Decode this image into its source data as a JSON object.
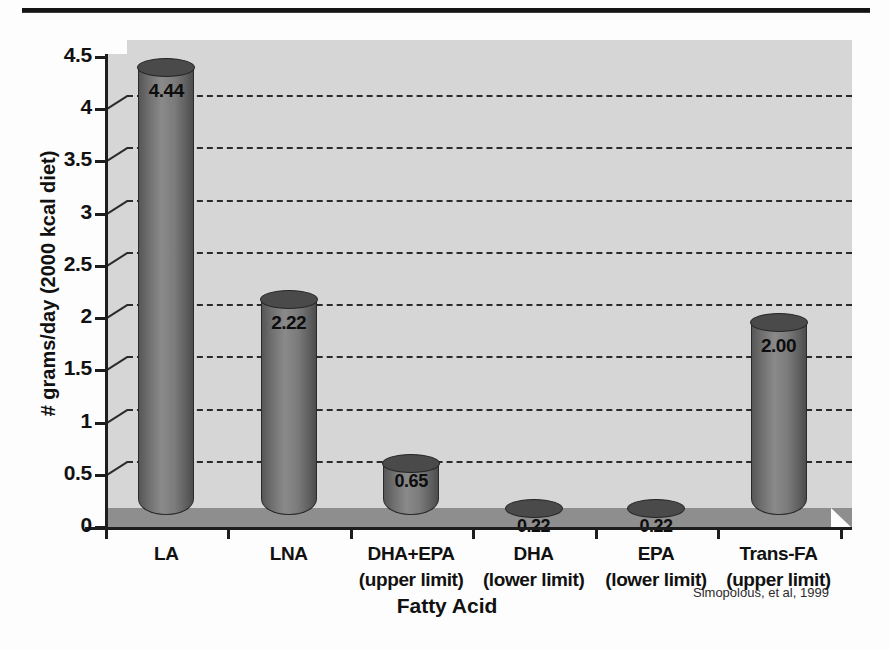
{
  "figure": {
    "citation": "Simopolous, et al, 1999",
    "colors": {
      "plot_background": "#d6d6d6",
      "floor": "#8e8e8e",
      "bar_fill": "#7b7b7b",
      "bar_top": "#4a4a4a",
      "axis": "#1d1d1d",
      "gridline": "#2b2b2b",
      "page_background": "#fdfdfd",
      "rule": "#141414"
    }
  },
  "chart_data": {
    "type": "bar",
    "title": "",
    "subtitle": "",
    "xlabel": "Fatty Acid",
    "ylabel": "# grams/day (2000 kcal diet)",
    "categories": [
      "LA",
      "LNA",
      "DHA+EPA",
      "DHA",
      "EPA",
      "Trans-FA"
    ],
    "category_sublabels": [
      "",
      "",
      "(upper limit)",
      "(lower limit)",
      "(lower limit)",
      "(upper limit)"
    ],
    "values": [
      4.44,
      2.22,
      0.65,
      0.22,
      0.22,
      2.0
    ],
    "value_labels": [
      "4.44",
      "2.22",
      "0.65",
      "0.22",
      "0.22",
      "2.00"
    ],
    "ylim": [
      0,
      4.5
    ],
    "ytick_values": [
      0,
      0.5,
      1,
      1.5,
      2,
      2.5,
      3,
      3.5,
      4,
      4.5
    ],
    "ytick_labels": [
      "0",
      "0.5",
      "1",
      "1.5",
      "2",
      "2.5",
      "3",
      "3.5",
      "4",
      "4.5"
    ],
    "grid": true,
    "grid_axis": "y",
    "grid_style": "dashed",
    "legend": false,
    "legend_position": "none",
    "style_3d": true,
    "bar_shape": "cylinder",
    "series": [
      {
        "name": "# grams/day (2000 kcal diet)",
        "values": [
          4.44,
          2.22,
          0.65,
          0.22,
          0.22,
          2.0
        ]
      }
    ]
  }
}
